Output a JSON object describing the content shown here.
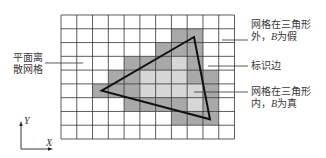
{
  "diagram": {
    "grid": {
      "left": 61,
      "top": 15,
      "right": 234.5,
      "bottom": 139,
      "cols": 11,
      "rows": 9,
      "line_color": "#333333",
      "colors": {
        "empty": "#ffffff",
        "edge": "#a9a9a9",
        "inside": "#d6d6d6"
      },
      "cells": [
        "...........",
        ".......EE..",
        "......EEE..",
        "....EEEIE..",
        "...EEIIIEE.",
        "..EEEIIIIE.",
        "....EEEEIE.",
        ".......EEE.",
        "..........."
      ]
    },
    "triangle": {
      "points": [
        [
          194,
          37
        ],
        [
          101.7,
          90.7
        ],
        [
          210,
          119.3
        ]
      ],
      "stroke": "#111111"
    },
    "labels": {
      "plane_grid": {
        "line1": "平面离",
        "line2": "散网格"
      },
      "outside": {
        "line1": "网格在三角形",
        "line2_prefix": "外，",
        "var": "B",
        "line2_suffix": "为假"
      },
      "edge": {
        "text": "标识边"
      },
      "inside": {
        "line1": "网格在三角形",
        "line2_prefix": "内，",
        "var": "B",
        "line2_suffix": "为真"
      }
    },
    "axes": {
      "x_label": "X",
      "y_label": "Y"
    }
  }
}
